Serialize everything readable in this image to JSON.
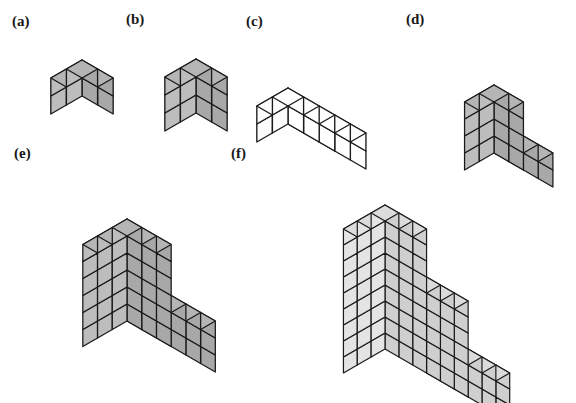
{
  "figure": {
    "background_color": "#ffffff",
    "outline_color": "#1a1a1a",
    "projection": "isometric",
    "labels": [
      {
        "id": "a",
        "text": "(a)",
        "x": 12,
        "y": 14
      },
      {
        "id": "b",
        "text": "(b)",
        "x": 126,
        "y": 12
      },
      {
        "id": "c",
        "text": "(c)",
        "x": 246,
        "y": 14
      },
      {
        "id": "d",
        "text": "(d)",
        "x": 406,
        "y": 12
      },
      {
        "id": "e",
        "text": "(e)",
        "x": 14,
        "y": 146
      },
      {
        "id": "f",
        "text": "(f)",
        "x": 231,
        "y": 146
      }
    ],
    "solids": [
      {
        "id": "a",
        "name": "cube-2x2x2",
        "caption": "(a)",
        "cube_count": 8,
        "dimensions": {
          "width": 2,
          "depth": 2,
          "height": 2
        },
        "shape": "rectangular-box",
        "unit": 18,
        "origin": {
          "x": 82,
          "y": 96
        },
        "colors": {
          "top": "#b5b5b5",
          "left": "#a8a8a8",
          "right": "#bdbdbd"
        },
        "columns": [
          {
            "x": 0,
            "y": 0,
            "h": 2
          },
          {
            "x": 1,
            "y": 0,
            "h": 2
          },
          {
            "x": 0,
            "y": 1,
            "h": 2
          },
          {
            "x": 1,
            "y": 1,
            "h": 2
          }
        ]
      },
      {
        "id": "b",
        "name": "box-2x2x3",
        "caption": "(b)",
        "cube_count": 12,
        "dimensions": {
          "width": 2,
          "depth": 2,
          "height": 3
        },
        "shape": "rectangular-box",
        "unit": 18,
        "origin": {
          "x": 196,
          "y": 113
        },
        "colors": {
          "top": "#b5b5b5",
          "left": "#a8a8a8",
          "right": "#bdbdbd"
        },
        "columns": [
          {
            "x": 0,
            "y": 0,
            "h": 3
          },
          {
            "x": 1,
            "y": 0,
            "h": 3
          },
          {
            "x": 0,
            "y": 1,
            "h": 3
          },
          {
            "x": 1,
            "y": 1,
            "h": 3
          }
        ]
      },
      {
        "id": "c",
        "name": "bar-2x5x2-white",
        "caption": "(c)",
        "cube_count": 20,
        "dimensions": {
          "width": 2,
          "depth": 5,
          "height": 2
        },
        "shape": "rectangular-bar",
        "unit": 18,
        "origin": {
          "x": 288,
          "y": 124
        },
        "colors": {
          "top": "#ffffff",
          "left": "#ffffff",
          "right": "#fcfcfc"
        },
        "columns": [
          {
            "x": 0,
            "y": 0,
            "h": 2
          },
          {
            "x": 1,
            "y": 0,
            "h": 2
          },
          {
            "x": 0,
            "y": 1,
            "h": 2
          },
          {
            "x": 1,
            "y": 1,
            "h": 2
          },
          {
            "x": 0,
            "y": 2,
            "h": 2
          },
          {
            "x": 1,
            "y": 2,
            "h": 2
          },
          {
            "x": 0,
            "y": 3,
            "h": 2
          },
          {
            "x": 1,
            "y": 3,
            "h": 2
          },
          {
            "x": 0,
            "y": 4,
            "h": 2
          },
          {
            "x": 1,
            "y": 4,
            "h": 2
          }
        ]
      },
      {
        "id": "d",
        "name": "l-shape-small",
        "caption": "(d)",
        "cube_count": 40,
        "dimensions": {
          "width": 2,
          "depth": 4,
          "height": 4
        },
        "shape": "L-shaped-step",
        "unit": 17,
        "origin": {
          "x": 494,
          "y": 153
        },
        "colors": {
          "top": "#b5b5b5",
          "left": "#a8a8a8",
          "right": "#bdbdbd"
        },
        "columns": [
          {
            "x": 0,
            "y": 0,
            "h": 4
          },
          {
            "x": 1,
            "y": 0,
            "h": 4
          },
          {
            "x": 0,
            "y": 1,
            "h": 4
          },
          {
            "x": 1,
            "y": 1,
            "h": 4
          },
          {
            "x": 0,
            "y": 2,
            "h": 2
          },
          {
            "x": 1,
            "y": 2,
            "h": 2
          },
          {
            "x": 0,
            "y": 3,
            "h": 2
          },
          {
            "x": 1,
            "y": 3,
            "h": 2
          }
        ]
      },
      {
        "id": "e",
        "name": "l-shape-large",
        "caption": "(e)",
        "cube_count": 90,
        "dimensions": {
          "width": 3,
          "depth": 6,
          "height": 6
        },
        "shape": "L-shaped-step",
        "unit": 17,
        "origin": {
          "x": 127,
          "y": 321
        },
        "colors": {
          "top": "#b5b5b5",
          "left": "#a8a8a8",
          "right": "#bdbdbd"
        },
        "columns": [
          {
            "x": 0,
            "y": 0,
            "h": 6
          },
          {
            "x": 1,
            "y": 0,
            "h": 6
          },
          {
            "x": 2,
            "y": 0,
            "h": 6
          },
          {
            "x": 0,
            "y": 1,
            "h": 6
          },
          {
            "x": 1,
            "y": 1,
            "h": 6
          },
          {
            "x": 2,
            "y": 1,
            "h": 6
          },
          {
            "x": 0,
            "y": 2,
            "h": 6
          },
          {
            "x": 1,
            "y": 2,
            "h": 6
          },
          {
            "x": 2,
            "y": 2,
            "h": 6
          },
          {
            "x": 0,
            "y": 3,
            "h": 3
          },
          {
            "x": 1,
            "y": 3,
            "h": 3
          },
          {
            "x": 2,
            "y": 3,
            "h": 3
          },
          {
            "x": 0,
            "y": 4,
            "h": 3
          },
          {
            "x": 1,
            "y": 4,
            "h": 3
          },
          {
            "x": 2,
            "y": 4,
            "h": 3
          },
          {
            "x": 0,
            "y": 5,
            "h": 3
          },
          {
            "x": 1,
            "y": 5,
            "h": 3
          },
          {
            "x": 2,
            "y": 5,
            "h": 3
          }
        ]
      },
      {
        "id": "f",
        "name": "staircase-3-step",
        "caption": "(f)",
        "cube_count": 135,
        "dimensions": {
          "width": 3,
          "depth": 9,
          "height": 9
        },
        "shape": "three-step-staircase",
        "unit": 16,
        "origin": {
          "x": 385,
          "y": 349
        },
        "colors": {
          "top": "#dcdcdc",
          "left": "#cfcfcf",
          "right": "#e4e4e4"
        },
        "columns": [
          {
            "x": 0,
            "y": 0,
            "h": 9
          },
          {
            "x": 1,
            "y": 0,
            "h": 9
          },
          {
            "x": 2,
            "y": 0,
            "h": 9
          },
          {
            "x": 0,
            "y": 1,
            "h": 9
          },
          {
            "x": 1,
            "y": 1,
            "h": 9
          },
          {
            "x": 2,
            "y": 1,
            "h": 9
          },
          {
            "x": 0,
            "y": 2,
            "h": 9
          },
          {
            "x": 1,
            "y": 2,
            "h": 9
          },
          {
            "x": 2,
            "y": 2,
            "h": 9
          },
          {
            "x": 0,
            "y": 3,
            "h": 6
          },
          {
            "x": 1,
            "y": 3,
            "h": 6
          },
          {
            "x": 2,
            "y": 3,
            "h": 6
          },
          {
            "x": 0,
            "y": 4,
            "h": 6
          },
          {
            "x": 1,
            "y": 4,
            "h": 6
          },
          {
            "x": 2,
            "y": 4,
            "h": 6
          },
          {
            "x": 0,
            "y": 5,
            "h": 6
          },
          {
            "x": 1,
            "y": 5,
            "h": 6
          },
          {
            "x": 2,
            "y": 5,
            "h": 6
          },
          {
            "x": 0,
            "y": 6,
            "h": 3
          },
          {
            "x": 1,
            "y": 6,
            "h": 3
          },
          {
            "x": 2,
            "y": 6,
            "h": 3
          },
          {
            "x": 0,
            "y": 7,
            "h": 3
          },
          {
            "x": 1,
            "y": 7,
            "h": 3
          },
          {
            "x": 2,
            "y": 7,
            "h": 3
          },
          {
            "x": 0,
            "y": 8,
            "h": 3
          },
          {
            "x": 1,
            "y": 8,
            "h": 3
          },
          {
            "x": 2,
            "y": 8,
            "h": 3
          }
        ]
      }
    ]
  }
}
